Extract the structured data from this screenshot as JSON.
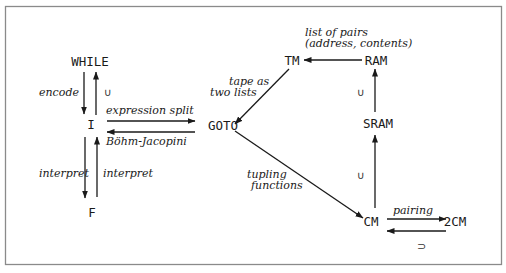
{
  "diagram": {
    "nodes": {
      "while": "WHILE",
      "i": "I",
      "f": "F",
      "goto": "GOTO",
      "tm": "TM",
      "ram": "RAM",
      "sram": "SRAM",
      "cm": "CM",
      "twocm": "2CM"
    },
    "edges": {
      "encode": "encode",
      "while_i_subset": "∪",
      "expression_split": "expression split",
      "bohm_jacopini": "Böhm-Jacopini",
      "interpret_down": "interpret",
      "interpret_up": "interpret",
      "tape_line1": "tape as",
      "tape_line2": "two lists",
      "pairs_line1": "list of pairs",
      "pairs_line2": "(address, contents)",
      "sram_ram_subset": "∪",
      "cm_sram_subset": "∪",
      "tupling_line1": "tupling",
      "tupling_line2": "functions",
      "pairing": "pairing",
      "twocm_cm_supset": "⊃"
    },
    "colors": {
      "stroke": "#1a1a1a",
      "frame": "#8a8a8a",
      "background": "#ffffff"
    }
  }
}
